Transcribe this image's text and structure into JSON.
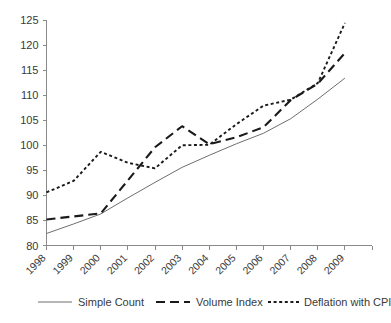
{
  "chart_data": {
    "type": "line",
    "title": "",
    "subtitle": "",
    "xlabel": "",
    "ylabel": "",
    "categories": [
      "1998",
      "1999",
      "2000",
      "2001",
      "2002",
      "2003",
      "2004",
      "2005",
      "2006",
      "2007",
      "2008",
      "2009"
    ],
    "x_tick_labels": [
      "1998",
      "1999",
      "2000",
      "2001",
      "2002",
      "2003",
      "2004",
      "2005",
      "2006",
      "2007",
      "2008",
      "2009"
    ],
    "x_tick_rotation_deg": -45,
    "y_tick_labels": [
      "80",
      "85",
      "90",
      "95",
      "100",
      "105",
      "110",
      "115",
      "120",
      "125"
    ],
    "y_ticks": [
      80,
      85,
      90,
      95,
      100,
      105,
      110,
      115,
      120,
      125
    ],
    "ylim": [
      80,
      125
    ],
    "grid": false,
    "legend_position": "bottom",
    "series": [
      {
        "name": "Simple Count",
        "style": "solid",
        "color": "#6e6e6e",
        "x": [
          1998,
          1999,
          2000,
          2001,
          2002,
          2003,
          2004,
          2005,
          2006,
          2007,
          2008,
          2009
        ],
        "values": [
          82.4,
          84.3,
          86.3,
          89.5,
          92.6,
          95.6,
          98.0,
          100.3,
          102.4,
          105.3,
          109.2,
          113.4
        ]
      },
      {
        "name": "Volume Index",
        "style": "long-dash",
        "color": "#1a1a1a",
        "x": [
          1998,
          1999,
          2000,
          2001,
          2002,
          2003,
          2004,
          2005,
          2006,
          2007,
          2008,
          2009
        ],
        "values": [
          85.2,
          85.8,
          86.4,
          93.0,
          99.6,
          103.8,
          100.2,
          101.6,
          103.6,
          109.0,
          112.3,
          118.4
        ]
      },
      {
        "name": "Deflation with CPI",
        "style": "dotted",
        "color": "#1a1a1a",
        "x": [
          1998,
          1999,
          2000,
          2001,
          2002,
          2003,
          2004,
          2005,
          2006,
          2007,
          2008,
          2009
        ],
        "values": [
          90.6,
          92.9,
          98.7,
          96.5,
          95.4,
          100.0,
          100.1,
          104.2,
          107.9,
          109.1,
          112.4,
          124.4
        ]
      }
    ]
  },
  "legend": {
    "items": [
      {
        "label": "Simple Count"
      },
      {
        "label": "Volume Index"
      },
      {
        "label": "Deflation with CPI"
      }
    ]
  }
}
